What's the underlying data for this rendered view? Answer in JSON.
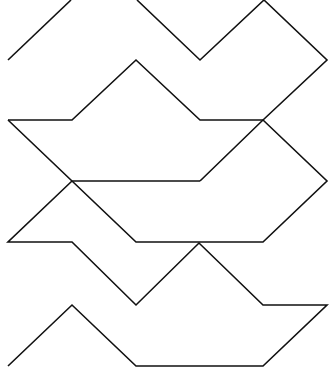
{
  "figure": {
    "stroke_color": "#111111",
    "background_color": "#ffffff",
    "polylines": [
      {
        "name": "top-left-diagonal",
        "points": "8,60 71,0"
      },
      {
        "name": "top-zigzag",
        "points": "137,0 200,60 264,0 327,60 263,120 200,181"
      },
      {
        "name": "upper-shape-top",
        "points": "8,120 72,120 136,60 200,120 263,120"
      },
      {
        "name": "upper-shape-left-diagonal",
        "points": "8,120 72,181 200,181"
      },
      {
        "name": "upper-right-diagonal",
        "points": "263,120 327,181 263,242 136,242 72,181"
      },
      {
        "name": "middle-shape-left",
        "points": "72,181 8,242 72,242 136,305 199,243 263,305 327,305 263,366 136,366 72,305 8,366"
      }
    ]
  }
}
